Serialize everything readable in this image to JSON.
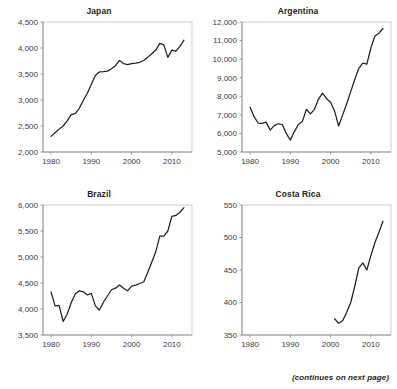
{
  "footer": {
    "note": "(continues on next page)"
  },
  "axis_defaults": {
    "xticks": [
      1980,
      1990,
      2000,
      2010
    ],
    "xlim": [
      1978,
      2015
    ]
  },
  "chart_data": [
    {
      "type": "line",
      "title": "Japan",
      "xlabel": "",
      "ylabel": "",
      "xlim": [
        1978,
        2015
      ],
      "ylim": [
        2000,
        4500
      ],
      "yticks": [
        2000,
        2500,
        3000,
        3500,
        4000,
        4500
      ],
      "ytick_labels": [
        "2,000",
        "2,500",
        "3,000",
        "3,500",
        "4,000",
        "4,500"
      ],
      "xticks": [
        1980,
        1990,
        2000,
        2010
      ],
      "xtick_labels": [
        "1980",
        "1990",
        "2000",
        "2010"
      ],
      "grid": false,
      "legend": "none",
      "x": [
        1980,
        1981,
        1982,
        1983,
        1984,
        1985,
        1986,
        1987,
        1988,
        1989,
        1990,
        1991,
        1992,
        1993,
        1994,
        1995,
        1996,
        1997,
        1998,
        1999,
        2000,
        2001,
        2002,
        2003,
        2004,
        2005,
        2006,
        2007,
        2008,
        2009,
        2010,
        2011,
        2012,
        2013
      ],
      "values": [
        2300,
        2370,
        2440,
        2500,
        2600,
        2720,
        2740,
        2840,
        2990,
        3130,
        3300,
        3470,
        3540,
        3545,
        3555,
        3600,
        3660,
        3760,
        3700,
        3680,
        3700,
        3710,
        3725,
        3760,
        3820,
        3890,
        3960,
        4090,
        4060,
        3820,
        3960,
        3940,
        4030,
        4150
      ]
    },
    {
      "type": "line",
      "title": "Argentina",
      "xlabel": "",
      "ylabel": "",
      "xlim": [
        1978,
        2015
      ],
      "ylim": [
        5000,
        12000
      ],
      "yticks": [
        5000,
        6000,
        7000,
        8000,
        9000,
        10000,
        11000,
        12000
      ],
      "ytick_labels": [
        "5,000",
        "6,000",
        "7,000",
        "8,000",
        "9,000",
        "10,000",
        "11,000",
        "12,000"
      ],
      "xticks": [
        1980,
        1990,
        2000,
        2010
      ],
      "xtick_labels": [
        "1980",
        "1990",
        "2000",
        "2010"
      ],
      "grid": false,
      "legend": "none",
      "x": [
        1980,
        1981,
        1982,
        1983,
        1984,
        1985,
        1986,
        1987,
        1988,
        1989,
        1990,
        1991,
        1992,
        1993,
        1994,
        1995,
        1996,
        1997,
        1998,
        1999,
        2000,
        2001,
        2002,
        2003,
        2004,
        2005,
        2006,
        2007,
        2008,
        2009,
        2010,
        2011,
        2012,
        2013
      ],
      "values": [
        7420,
        6900,
        6560,
        6540,
        6610,
        6180,
        6420,
        6520,
        6480,
        6000,
        5640,
        6100,
        6480,
        6650,
        7300,
        7050,
        7300,
        7850,
        8170,
        7870,
        7680,
        7200,
        6400,
        7000,
        7600,
        8250,
        8900,
        9500,
        9780,
        9730,
        10600,
        11250,
        11400,
        11650
      ]
    },
    {
      "type": "line",
      "title": "Brazil",
      "xlabel": "",
      "ylabel": "",
      "xlim": [
        1978,
        2015
      ],
      "ylim": [
        3500,
        6000
      ],
      "yticks": [
        3500,
        4000,
        4500,
        5000,
        5500,
        6000
      ],
      "ytick_labels": [
        "3,500",
        "4,000",
        "4,500",
        "5,000",
        "5,500",
        "6,000"
      ],
      "xticks": [
        1980,
        1990,
        2000,
        2010
      ],
      "xtick_labels": [
        "1980",
        "1990",
        "2000",
        "2010"
      ],
      "grid": false,
      "legend": "none",
      "x": [
        1980,
        1981,
        1982,
        1983,
        1984,
        1985,
        1986,
        1987,
        1988,
        1989,
        1990,
        1991,
        1992,
        1993,
        1994,
        1995,
        1996,
        1997,
        1998,
        1999,
        2000,
        2001,
        2002,
        2003,
        2004,
        2005,
        2006,
        2007,
        2008,
        2009,
        2010,
        2011,
        2012,
        2013
      ],
      "values": [
        4330,
        4060,
        4070,
        3760,
        3900,
        4120,
        4290,
        4350,
        4330,
        4270,
        4300,
        4060,
        3980,
        4130,
        4250,
        4370,
        4400,
        4460,
        4400,
        4350,
        4440,
        4460,
        4490,
        4520,
        4700,
        4900,
        5100,
        5400,
        5400,
        5500,
        5780,
        5800,
        5860,
        5950
      ]
    },
    {
      "type": "line",
      "title": "Costa Rica",
      "xlabel": "",
      "ylabel": "",
      "xlim": [
        1978,
        2015
      ],
      "ylim": [
        350,
        550
      ],
      "yticks": [
        350,
        400,
        450,
        500,
        550
      ],
      "ytick_labels": [
        "350",
        "400",
        "450",
        "500",
        "550"
      ],
      "xticks": [
        1980,
        1990,
        2000,
        2010
      ],
      "xtick_labels": [
        "1980",
        "1990",
        "2000",
        "2010"
      ],
      "grid": false,
      "legend": "none",
      "x": [
        2001,
        2002,
        2003,
        2004,
        2005,
        2006,
        2007,
        2008,
        2009,
        2010,
        2011,
        2012,
        2013
      ],
      "values": [
        375,
        368,
        372,
        385,
        400,
        425,
        453,
        461,
        450,
        472,
        492,
        508,
        525
      ]
    }
  ]
}
